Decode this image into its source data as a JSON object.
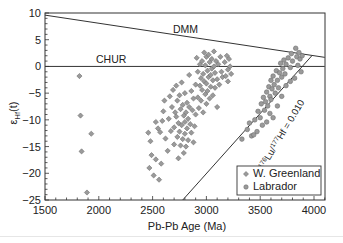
{
  "chart_data": {
    "type": "scatter",
    "title": "",
    "xlabel": "Pb-Pb Age (Ma)",
    "ylabel": "εHf(t)",
    "ylabel_main": "ε",
    "ylabel_sub": "Hf",
    "ylabel_suffix": "(t)",
    "xlim": [
      1500,
      4100
    ],
    "ylim": [
      -25,
      10
    ],
    "x_ticks": [
      1500,
      2000,
      2500,
      3000,
      3500,
      4000
    ],
    "x_tick_labels": [
      "1500",
      "2000",
      "2500",
      "3000",
      "3500",
      "4000"
    ],
    "y_ticks": [
      10,
      5,
      0,
      -5,
      -10,
      -15,
      -20,
      -25
    ],
    "y_tick_labels": [
      "10",
      "5",
      "0",
      "−5",
      "−10",
      "−15",
      "−20",
      "−25"
    ],
    "grid": false,
    "legend_position": "lower right",
    "reference_lines": [
      {
        "name": "DMM",
        "label": "DMM",
        "x": [
          1500,
          4100
        ],
        "y": [
          9.6,
          1.7
        ]
      },
      {
        "name": "CHUR",
        "label": "CHUR",
        "x": [
          1500,
          4100
        ],
        "y": [
          0,
          0
        ]
      },
      {
        "name": "Lu/Hf evolution",
        "label_pre": "176",
        "label_a": "Lu/",
        "label_sup": "177",
        "label_b": "Hf = 0.010",
        "label": "176Lu/177Hf = 0.010",
        "x": [
          2780,
          3980
        ],
        "y": [
          -25,
          2.0
        ]
      }
    ],
    "series": [
      {
        "name": "W. Greenland",
        "marker": "diamond",
        "color": "#8c8c8c",
        "points": [
          [
            1820,
            -1.8
          ],
          [
            1830,
            -9.2
          ],
          [
            1840,
            -15.9
          ],
          [
            1890,
            -23.6
          ],
          [
            1930,
            -12.6
          ],
          [
            2530,
            -10.4
          ],
          [
            2550,
            -11.6
          ],
          [
            2570,
            -12.3
          ],
          [
            2590,
            -10.2
          ],
          [
            2600,
            -8.4
          ],
          [
            2610,
            -6.4
          ],
          [
            2620,
            -13.5
          ],
          [
            2640,
            -15.8
          ],
          [
            2650,
            -9.8
          ],
          [
            2660,
            -5.6
          ],
          [
            2670,
            -12.1
          ],
          [
            2680,
            -7.6
          ],
          [
            2690,
            -4.4
          ],
          [
            2700,
            -11.4
          ],
          [
            2700,
            -14.6
          ],
          [
            2710,
            -8.6
          ],
          [
            2720,
            -3.6
          ],
          [
            2720,
            -9.4
          ],
          [
            2730,
            -6.4
          ],
          [
            2730,
            -13.2
          ],
          [
            2740,
            -10.6
          ],
          [
            2740,
            -17.2
          ],
          [
            2750,
            -5.4
          ],
          [
            2750,
            -12.2
          ],
          [
            2760,
            -8.0
          ],
          [
            2760,
            -14.8
          ],
          [
            2770,
            -3.0
          ],
          [
            2770,
            -11.0
          ],
          [
            2780,
            -7.2
          ],
          [
            2780,
            -13.6
          ],
          [
            2790,
            -9.2
          ],
          [
            2790,
            -16.2
          ],
          [
            2800,
            -5.0
          ],
          [
            2800,
            -10.4
          ],
          [
            2800,
            -12.6
          ],
          [
            2810,
            -8.6
          ],
          [
            2810,
            -15.0
          ],
          [
            2820,
            -6.8
          ],
          [
            2820,
            -11.6
          ],
          [
            2830,
            -9.8
          ],
          [
            2830,
            -13.8
          ],
          [
            2840,
            -1.6
          ],
          [
            2840,
            -7.6
          ],
          [
            2850,
            -10.8
          ],
          [
            2860,
            -4.6
          ],
          [
            2860,
            -12.4
          ],
          [
            2870,
            -8.2
          ],
          [
            2880,
            -6.0
          ],
          [
            2880,
            -14.2
          ],
          [
            2890,
            -11.2
          ],
          [
            2900,
            -3.4
          ],
          [
            2900,
            -9.0
          ],
          [
            2910,
            1.6
          ],
          [
            2920,
            -5.8
          ],
          [
            2920,
            -1.0
          ],
          [
            2930,
            -7.8
          ],
          [
            2940,
            0.4
          ],
          [
            2940,
            -3.6
          ],
          [
            2950,
            -2.2
          ],
          [
            2950,
            -6.4
          ],
          [
            2960,
            1.0
          ],
          [
            2960,
            -4.4
          ],
          [
            2970,
            -1.4
          ],
          [
            2970,
            -8.6
          ],
          [
            2980,
            2.6
          ],
          [
            2980,
            -2.8
          ],
          [
            2990,
            0.2
          ],
          [
            2990,
            -5.2
          ],
          [
            3000,
            1.8
          ],
          [
            3000,
            -3.2
          ],
          [
            3000,
            -7.0
          ],
          [
            3010,
            -0.8
          ],
          [
            3010,
            -4.6
          ],
          [
            3020,
            2.2
          ],
          [
            3020,
            -2.0
          ],
          [
            3030,
            0.8
          ],
          [
            3030,
            -6.0
          ],
          [
            3040,
            -1.6
          ],
          [
            3040,
            -3.8
          ],
          [
            3050,
            1.4
          ],
          [
            3050,
            -0.4
          ],
          [
            3060,
            -2.6
          ],
          [
            3060,
            -5.4
          ],
          [
            3070,
            0.0
          ],
          [
            3070,
            2.8
          ],
          [
            3080,
            -1.2
          ],
          [
            3080,
            -4.0
          ],
          [
            3090,
            1.0
          ],
          [
            3100,
            -2.4
          ],
          [
            3100,
            -7.6
          ],
          [
            3110,
            0.4
          ],
          [
            3120,
            -3.4
          ],
          [
            3130,
            1.8
          ],
          [
            3140,
            -1.0
          ],
          [
            3150,
            -2.0
          ],
          [
            3170,
            0.8
          ],
          [
            3180,
            -1.8
          ],
          [
            3190,
            2.0
          ],
          [
            3200,
            -0.6
          ],
          [
            3200,
            -2.8
          ],
          [
            3210,
            1.4
          ],
          [
            3220,
            0.0
          ],
          [
            3230,
            -1.4
          ],
          [
            2460,
            -12.4
          ],
          [
            2480,
            -14.0
          ],
          [
            2490,
            -16.6
          ],
          [
            2510,
            -20.4
          ],
          [
            2470,
            -19.0
          ],
          [
            2530,
            -17.4
          ],
          [
            2560,
            -21.2
          ],
          [
            2580,
            -18.2
          ]
        ]
      },
      {
        "name": "Labrador",
        "marker": "circle",
        "color": "#8c8c8c",
        "points": [
          [
            3330,
            -13.6
          ],
          [
            3380,
            -11.8
          ],
          [
            3420,
            -13.0
          ],
          [
            3450,
            -10.0
          ],
          [
            3470,
            -12.2
          ],
          [
            3480,
            -8.4
          ],
          [
            3500,
            -9.6
          ],
          [
            3510,
            -7.0
          ],
          [
            3520,
            -11.0
          ],
          [
            3530,
            -5.8
          ],
          [
            3540,
            -8.2
          ],
          [
            3550,
            -6.6
          ],
          [
            3560,
            -4.8
          ],
          [
            3570,
            -7.4
          ],
          [
            3580,
            -3.8
          ],
          [
            3590,
            -5.6
          ],
          [
            3600,
            -2.6
          ],
          [
            3600,
            -6.2
          ],
          [
            3610,
            -4.2
          ],
          [
            3620,
            -1.8
          ],
          [
            3630,
            -3.4
          ],
          [
            3640,
            -5.0
          ],
          [
            3650,
            -0.8
          ],
          [
            3660,
            -2.6
          ],
          [
            3670,
            -4.0
          ],
          [
            3680,
            -1.2
          ],
          [
            3690,
            0.6
          ],
          [
            3700,
            -2.0
          ],
          [
            3710,
            -0.4
          ],
          [
            3720,
            1.2
          ],
          [
            3730,
            -1.4
          ],
          [
            3740,
            0.4
          ],
          [
            3760,
            1.6
          ],
          [
            3780,
            -0.2
          ],
          [
            3790,
            2.4
          ],
          [
            3800,
            1.0
          ],
          [
            3820,
            -2.2
          ],
          [
            3830,
            3.4
          ],
          [
            3840,
            1.8
          ],
          [
            3850,
            0.2
          ],
          [
            3860,
            2.6
          ],
          [
            3870,
            1.4
          ],
          [
            3880,
            -1.0
          ],
          [
            3890,
            2.0
          ],
          [
            3620,
            -9.6
          ],
          [
            3560,
            -10.4
          ],
          [
            3590,
            -8.8
          ],
          [
            3660,
            -7.4
          ],
          [
            3700,
            -5.6
          ],
          [
            3740,
            -3.6
          ],
          [
            3780,
            -2.8
          ],
          [
            3400,
            -10.6
          ],
          [
            3440,
            -12.8
          ]
        ]
      }
    ]
  },
  "legend": {
    "items": [
      {
        "label": "W. Greenland",
        "marker": "diamond"
      },
      {
        "label": "Labrador",
        "marker": "circle"
      }
    ]
  }
}
